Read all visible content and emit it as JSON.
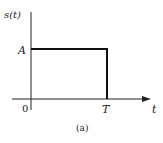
{
  "figure": {
    "caption": "(a)",
    "y_axis_label": "s(t)",
    "x_axis_label": "t",
    "amplitude_label": "A",
    "origin_label": "0",
    "end_label": "T"
  },
  "signal": {
    "type": "rectangular-pulse",
    "amplitude": "A",
    "start": "0",
    "end": "T"
  },
  "colors": {
    "line": "#111111",
    "axis": "#222222",
    "background": "#ffffff"
  }
}
